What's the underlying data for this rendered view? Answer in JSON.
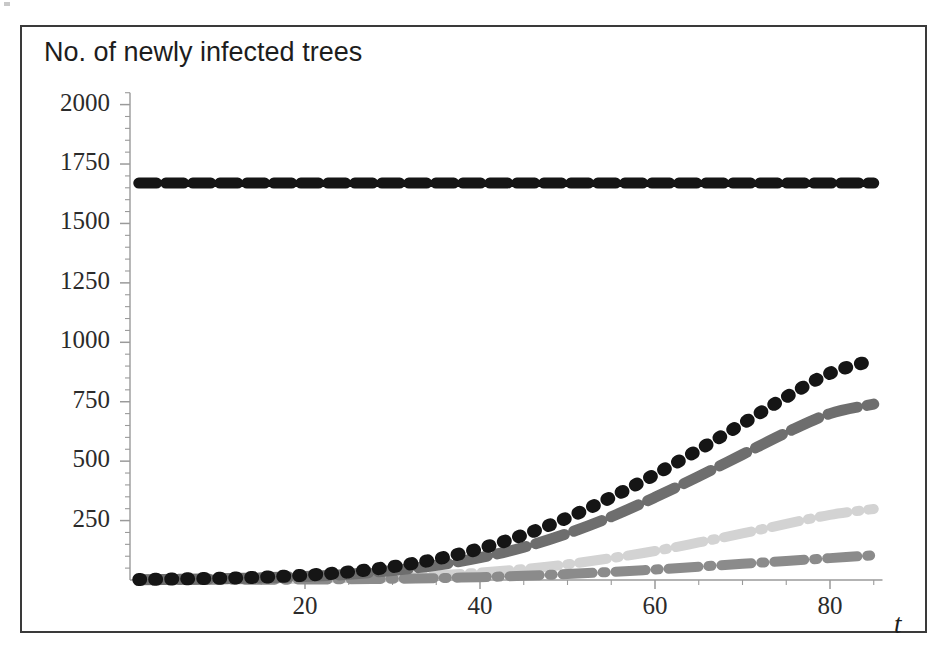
{
  "figure": {
    "title": "No. of newly infected trees",
    "x_axis_name": "t",
    "frame_color": "#3a3a3a",
    "background": "#ffffff"
  },
  "chart_data": {
    "type": "line",
    "title": "No. of newly infected trees",
    "xlabel": "t",
    "ylabel": "No. of newly infected trees",
    "xlim": [
      0,
      86
    ],
    "ylim": [
      0,
      2050
    ],
    "grid": false,
    "legend": "none",
    "x_ticks": [
      20,
      40,
      60,
      80
    ],
    "x_tick_labels": [
      "20",
      "40",
      "60",
      "80"
    ],
    "x_minor_tick_step": 5,
    "y_ticks": [
      250,
      500,
      750,
      1000,
      1250,
      1500,
      1750,
      2000
    ],
    "y_tick_labels": [
      "250",
      "500",
      "750",
      "1000",
      "1250",
      "1500",
      "1750",
      "2000"
    ],
    "y_minor_tick_step": 50,
    "x": [
      1,
      5,
      10,
      15,
      20,
      25,
      30,
      35,
      40,
      45,
      50,
      55,
      60,
      65,
      70,
      75,
      80,
      85
    ],
    "series": [
      {
        "name": "no-control-baseline",
        "style": "dashed",
        "color": "#151515",
        "dash": "18 9",
        "width": 11,
        "values": [
          1670,
          1670,
          1670,
          1670,
          1670,
          1670,
          1670,
          1670,
          1670,
          1670,
          1670,
          1670,
          1670,
          1670,
          1670,
          1670,
          1670,
          1670
        ]
      },
      {
        "name": "scenario-black-dotted",
        "style": "dotted",
        "color": "#151515",
        "dash": "2 14",
        "width": 13,
        "values": [
          2,
          4,
          7,
          12,
          20,
          34,
          56,
          88,
          132,
          190,
          262,
          348,
          444,
          548,
          658,
          770,
          870,
          925
        ]
      },
      {
        "name": "scenario-dark-gray-dashed",
        "style": "dashed",
        "color": "#6e6e6e",
        "dash": "30 10",
        "width": 11,
        "values": [
          1,
          3,
          5,
          9,
          15,
          24,
          40,
          62,
          94,
          138,
          196,
          266,
          348,
          436,
          528,
          620,
          700,
          740
        ]
      },
      {
        "name": "scenario-light-gray-dashdot",
        "style": "dashdot",
        "color": "#d3d3d3",
        "dash": "28 9 3 9",
        "width": 10,
        "values": [
          0,
          1,
          2,
          3,
          5,
          8,
          13,
          20,
          31,
          46,
          66,
          92,
          122,
          158,
          196,
          236,
          274,
          299
        ]
      },
      {
        "name": "scenario-medium-gray-dashdot",
        "style": "dashdot",
        "color": "#8b8b8b",
        "dash": "30 10 3 10",
        "width": 10,
        "values": [
          0,
          0,
          1,
          1,
          2,
          3,
          5,
          8,
          12,
          18,
          25,
          34,
          44,
          56,
          68,
          80,
          92,
          104
        ]
      }
    ]
  },
  "geometry": {
    "origin_x_px": 128,
    "origin_y_px": 578,
    "px_per_x_unit": 8.75,
    "px_per_y_unit": 0.2377,
    "axis_color": "#9a9a9a"
  }
}
